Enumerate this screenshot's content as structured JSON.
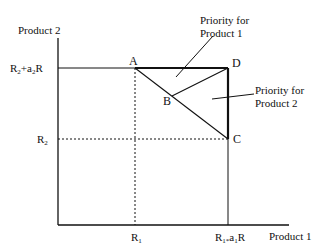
{
  "axes": {
    "y_label": "Product 2",
    "x_label": "Product 1"
  },
  "ticks": {
    "y_top": {
      "base": "R",
      "sub": "2",
      "rest1": "+a",
      "sub2": "2",
      "rest2": "R"
    },
    "y_mid": {
      "base": "R",
      "sub": "2"
    },
    "x_mid": {
      "base": "R",
      "sub": "1"
    },
    "x_right": {
      "base": "R",
      "sub": "1*",
      "rest1": "a",
      "sub2": "1",
      "rest2": "R"
    }
  },
  "points": {
    "A": "A",
    "B": "B",
    "C": "C",
    "D": "D"
  },
  "annotations": {
    "priority1_line1": "Priority for",
    "priority1_line2": "Product 1",
    "priority2_line1": "Priority for",
    "priority2_line2": "Product 2"
  },
  "colors": {
    "ink": "#111111",
    "background": "#ffffff"
  }
}
